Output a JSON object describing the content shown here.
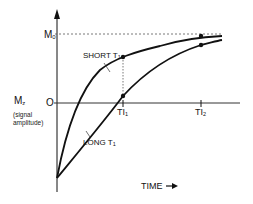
{
  "diagram": {
    "type": "T1 recovery curves (longitudinal magnetization vs time)",
    "y_axis": {
      "label_main": "M",
      "label_sub": "z",
      "label_note_line1": "(signal",
      "label_note_line2": "amplitude)",
      "ticks": [
        {
          "label": "M",
          "sub": "0",
          "meaning": "equilibrium magnetization"
        },
        {
          "label": "O",
          "meaning": "zero"
        }
      ]
    },
    "x_axis": {
      "label": "TIME",
      "arrow": "→",
      "ticks": [
        {
          "label": "TI",
          "sub": "1"
        },
        {
          "label": "TI",
          "sub": "2"
        }
      ]
    },
    "curves": [
      {
        "name": "SHORT T",
        "sub": "1",
        "start": "-M0",
        "at_TI1": "high positive",
        "at_TI2": "~M0"
      },
      {
        "name": "LONG T",
        "sub": "1",
        "start": "-M0",
        "at_TI1": "~0",
        "at_TI2": "slightly below M0"
      }
    ],
    "annotations": {
      "short_label": "SHORT T",
      "short_sub": "1",
      "long_label": "LONG T",
      "long_sub": "1"
    },
    "colors": {
      "line": "#111111",
      "background": "#ffffff",
      "dashed": "#555555"
    }
  }
}
